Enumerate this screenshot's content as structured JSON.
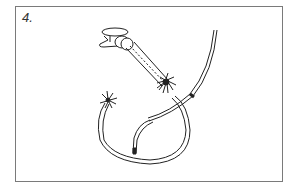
{
  "figure": {
    "step_label": "4.",
    "colors": {
      "line": "#222222",
      "frame": "#7a7a7a",
      "background": "#ffffff"
    }
  }
}
